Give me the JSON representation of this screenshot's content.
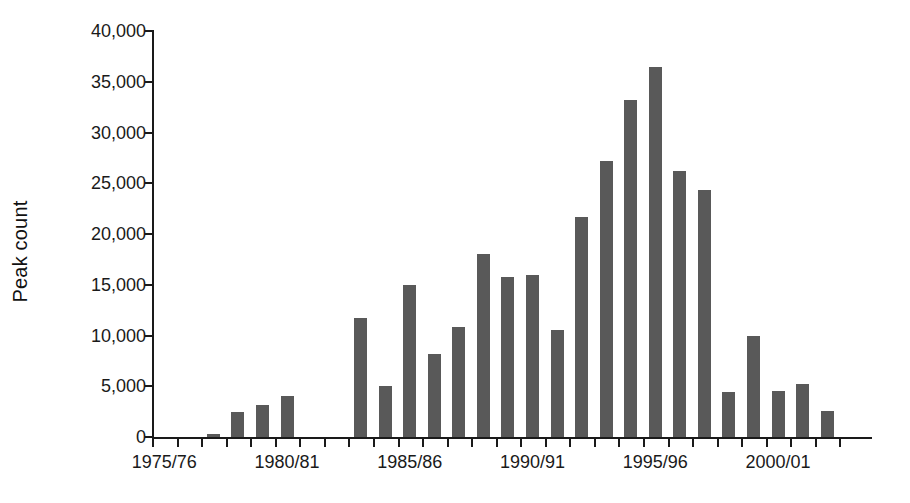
{
  "chart_data": {
    "type": "bar",
    "title": "",
    "xlabel": "",
    "ylabel": "Peak count",
    "ylim": [
      0,
      40000
    ],
    "ytick_values": [
      0,
      5000,
      10000,
      15000,
      20000,
      25000,
      30000,
      35000,
      40000
    ],
    "ytick_labels": [
      "0",
      "5,000",
      "10,000",
      "15,000",
      "20,000",
      "25,000",
      "30,000",
      "35,000",
      "40,000"
    ],
    "grid": false,
    "legend": null,
    "bar_color": "#595959",
    "axis_color": "#1a1a1a",
    "background_color": "#ffffff",
    "categories": [
      "1975/76",
      "1976/77",
      "1977/78",
      "1978/79",
      "1979/80",
      "1980/81",
      "1981/82",
      "1982/83",
      "1983/84",
      "1984/85",
      "1985/86",
      "1986/87",
      "1987/88",
      "1988/89",
      "1989/90",
      "1990/91",
      "1991/92",
      "1992/93",
      "1993/94",
      "1994/95",
      "1995/96",
      "1996/97",
      "1997/98",
      "1998/99",
      "1999/00",
      "2000/01",
      "2001/02",
      "2002/03"
    ],
    "values": [
      null,
      null,
      300,
      2500,
      3200,
      4000,
      null,
      null,
      11700,
      5000,
      15000,
      8200,
      10800,
      18000,
      15800,
      16000,
      10500,
      21700,
      27200,
      33200,
      36500,
      26200,
      24300,
      4400,
      10000,
      4500,
      5200,
      2600
    ],
    "xtick_labels_shown": [
      "1975/76",
      "1980/81",
      "1985/86",
      "1990/91",
      "1995/96",
      "2000/01"
    ],
    "xtick_label_indices": [
      0,
      5,
      10,
      15,
      20,
      25
    ]
  }
}
